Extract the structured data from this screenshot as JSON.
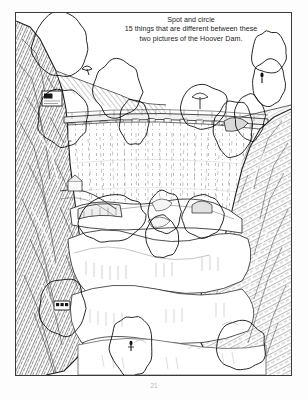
{
  "page": {
    "background_color": "#ffffff",
    "frame_color": "#3a3a3a",
    "ink_color": "#1b1b1b",
    "annotation_color": "#000000",
    "page_number": "21"
  },
  "caption": {
    "line1": "Spot and circle",
    "line2": "15 things that are different between these",
    "line3": "two pictures of the Hoover Dam."
  },
  "artwork": {
    "title": "Hoover Dam line drawing",
    "description": "Pen-and-ink style drawing of the Hoover Dam seen from above the downstream face, with steep hatched canyon walls on the left and right, the curved dam crest with a row of intake pillars across the upper middle, long vertical streak lines down the dam face, and billowing white water and rock formations filling the lower half.",
    "elements": [
      {
        "name": "left-canyon-wall",
        "label": "Left canyon cliff, dense cross-hatching"
      },
      {
        "name": "right-canyon-wall",
        "label": "Right canyon cliff, dense cross-hatching"
      },
      {
        "name": "dam-crest",
        "label": "Dam crest roadway with railing"
      },
      {
        "name": "intake-pillars",
        "label": "Row of intake tower pillars along the crest"
      },
      {
        "name": "dam-face",
        "label": "Curved concrete dam face with vertical streaks"
      },
      {
        "name": "spillway-water",
        "label": "White churning water and rock below the dam"
      },
      {
        "name": "access-road",
        "label": "Switchback access road on the left bank"
      }
    ]
  },
  "annotations": {
    "label": "Hand-drawn circles marking spotted differences",
    "count": 15,
    "circles": [
      {
        "id": 1,
        "name": "circle-top-left-skyline",
        "cx": 16,
        "cy": 9,
        "rx": 10.5,
        "ry": 9.0,
        "rot": -8,
        "contains": "empty-sky"
      },
      {
        "id": 2,
        "name": "circle-bird-figure",
        "cx": 37,
        "cy": 21,
        "rx": 9.0,
        "ry": 8.0,
        "rot": 6,
        "contains": "bird-glyph"
      },
      {
        "id": 3,
        "name": "circle-sign-board",
        "cx": 17,
        "cy": 29,
        "rx": 9.5,
        "ry": 8.0,
        "rot": -4,
        "contains": "billboard-sign"
      },
      {
        "id": 4,
        "name": "circle-crest-pillar-left",
        "cx": 43,
        "cy": 30,
        "rx": 5.5,
        "ry": 6.5,
        "rot": 3,
        "contains": "intake-pillar"
      },
      {
        "id": 5,
        "name": "circle-crest-tree",
        "cx": 68,
        "cy": 26,
        "rx": 9.0,
        "ry": 6.0,
        "rot": -3,
        "contains": "tree-on-crest"
      },
      {
        "id": 6,
        "name": "circle-crest-pillar-right",
        "cx": 85,
        "cy": 29,
        "rx": 5.5,
        "ry": 6.5,
        "rot": -5,
        "contains": "intake-pillar"
      },
      {
        "id": 7,
        "name": "circle-upper-right-empty",
        "cx": 92,
        "cy": 11,
        "rx": 6.5,
        "ry": 6.0,
        "rot": 0,
        "contains": "empty-sky"
      },
      {
        "id": 8,
        "name": "circle-upper-right-figure",
        "cx": 92,
        "cy": 19,
        "rx": 6.0,
        "ry": 6.5,
        "rot": 4,
        "contains": "small-figure"
      },
      {
        "id": 9,
        "name": "circle-ridge-rock",
        "cx": 79,
        "cy": 32,
        "rx": 7.0,
        "ry": 8.0,
        "rot": 7,
        "contains": "rock-outcrop"
      },
      {
        "id": 10,
        "name": "circle-boat-left",
        "cx": 35,
        "cy": 57,
        "rx": 12.0,
        "ry": 6.5,
        "rot": -6,
        "contains": "boat-hull"
      },
      {
        "id": 11,
        "name": "circle-rock-mid",
        "cx": 54,
        "cy": 55,
        "rx": 6.0,
        "ry": 6.0,
        "rot": 0,
        "contains": "rock-detail"
      },
      {
        "id": 12,
        "name": "circle-rock-mid-lower",
        "cx": 53,
        "cy": 62,
        "rx": 6.0,
        "ry": 6.0,
        "rot": 0,
        "contains": "rock-detail"
      },
      {
        "id": 13,
        "name": "circle-cave-right",
        "cx": 68,
        "cy": 56,
        "rx": 7.5,
        "ry": 6.0,
        "rot": -4,
        "contains": "cave-opening"
      },
      {
        "id": 14,
        "name": "circle-bus-vehicle",
        "cx": 17,
        "cy": 81,
        "rx": 8.5,
        "ry": 8.0,
        "rot": 5,
        "contains": "vehicle"
      },
      {
        "id": 15,
        "name": "circle-lower-figure",
        "cx": 42,
        "cy": 92,
        "rx": 8.0,
        "ry": 8.5,
        "rot": -6,
        "contains": "small-figure"
      },
      {
        "id": 16,
        "name": "circle-lower-right-empty",
        "cx": 82,
        "cy": 92,
        "rx": 9.0,
        "ry": 7.0,
        "rot": 4,
        "contains": "empty-water"
      }
    ]
  }
}
